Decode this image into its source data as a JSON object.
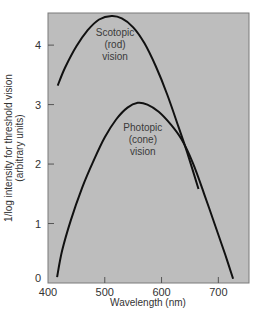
{
  "chart_data": {
    "type": "line",
    "title": "",
    "xlabel": "Wavelength (nm)",
    "ylabel_lines": [
      "1/log intensity for threshold vision",
      "(arbitrary units)"
    ],
    "ylabel": "1/log intensity for threshold vision (arbitrary units)",
    "xlim": [
      400,
      754
    ],
    "ylim": [
      0,
      4.54
    ],
    "xticks": [
      400,
      500,
      600,
      700
    ],
    "yticks": [
      0,
      1,
      2,
      3,
      4
    ],
    "grid": false,
    "legend": null,
    "background_color": "#bdbdbd",
    "line_color": "#111111",
    "series": [
      {
        "name": "Scotopic (rod) vision",
        "x": [
          417,
          430,
          450,
          470,
          490,
          512,
          530,
          550,
          570,
          590,
          610,
          630,
          645,
          665
        ],
        "y": [
          3.32,
          3.62,
          3.98,
          4.25,
          4.43,
          4.49,
          4.45,
          4.3,
          4.03,
          3.64,
          3.17,
          2.62,
          2.2,
          1.58
        ]
      },
      {
        "name": "Photopic (cone) vision",
        "x": [
          416,
          425,
          440,
          460,
          480,
          500,
          520,
          540,
          558,
          575,
          595,
          615,
          635,
          655,
          675,
          695,
          712,
          726
        ],
        "y": [
          0.1,
          0.55,
          1.05,
          1.6,
          2.05,
          2.45,
          2.75,
          2.95,
          3.03,
          3.0,
          2.88,
          2.68,
          2.42,
          2.02,
          1.5,
          0.95,
          0.48,
          0.07
        ]
      }
    ],
    "annotations": [
      {
        "series": "Scotopic (rod) vision",
        "lines": [
          "Scotopic",
          "(rod)",
          "vision"
        ],
        "x": 518,
        "y": 4.15
      },
      {
        "series": "Photopic (cone) vision",
        "lines": [
          "Photopic",
          "(cone)",
          "vision"
        ],
        "x": 567,
        "y": 2.55
      }
    ]
  }
}
